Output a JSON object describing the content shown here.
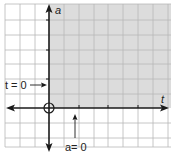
{
  "diagram": {
    "type": "coordinate-plane",
    "axes": {
      "horizontal_label": "t",
      "vertical_label": "a"
    },
    "shaded_region": "quadrant I (t ≥ 0, a ≥ 0)",
    "annotations": [
      {
        "text": "t = 0",
        "points_to": "vertical axis"
      },
      {
        "text": "a= 0",
        "points_to": "horizontal axis"
      }
    ],
    "origin_marker": "circle",
    "colors": {
      "shade": "#dcdcdc",
      "grid": "#b8b8b8",
      "axis": "#1a1a1a",
      "background": "#ffffff"
    }
  }
}
